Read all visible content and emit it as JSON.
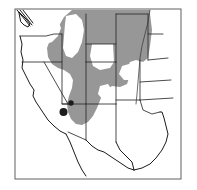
{
  "figure": {
    "kind": "distribution-map",
    "region": "Western United States",
    "width": 197,
    "height": 190,
    "background_color": "#ffffff"
  },
  "frame": {
    "x": 15,
    "y": 9,
    "width": 166,
    "height": 170,
    "stroke_color": "#6e6e6e",
    "fill_color": "#ffffff",
    "stroke_width": 1.1
  },
  "legend_colors": {
    "range_shading": "#979797",
    "range_gap": "#ffffff",
    "occurrence_point": "#1c1c1c",
    "state_boundary": "#2a2a2a",
    "coastline": "#1a1a1a",
    "river": "#3a3a3a",
    "frame": "#6e6e6e"
  },
  "range_shading": {
    "label": "shaded distribution range",
    "color": "#979797",
    "outline": "M 72,10 L 150,10 L 150,14 L 152,30 L 150,46 L 148,58 L 143,62 L 136,60 L 130,62 L 127,70 L 129,78 L 127,84 L 120,87 L 112,86 L 106,90 L 101,98 L 97,108 L 93,116 L 88,122 L 82,125 L 76,124 L 71,119 L 68,112 L 67,104 L 69,96 L 72,88 L 73,80 L 70,74 L 64,70 L 58,68 L 52,64 L 48,57 L 47,48 L 50,40 L 55,32 L 60,24 L 64,17 Z",
    "gaps": [
      {
        "name": "idaho-panhandle-gap",
        "path": "M 50,18 L 58,20 L 61,28 L 58,36 L 52,42 L 46,44 L 42,40 L 43,32 L 46,24 Z"
      },
      {
        "name": "central-idaho-gap",
        "path": "M 66,16 L 76,14 L 82,20 L 84,30 L 82,42 L 78,52 L 72,58 L 66,56 L 63,48 L 64,36 L 65,24 Z"
      },
      {
        "name": "wyoming-basin-gap",
        "path": "M 92,44 L 113,44 L 114,62 L 110,68 L 100,70 L 93,66 L 90,56 Z"
      },
      {
        "name": "eastern-plains-gap",
        "path": "M 122,66 L 136,62 L 142,66 L 140,74 L 132,80 L 124,80 L 119,74 Z"
      },
      {
        "name": "south-central-gap",
        "path": "M 100,86 L 108,84 L 112,90 L 110,98 L 103,100 L 98,94 Z"
      }
    ]
  },
  "state_boundaries": {
    "label": "state boundary lines",
    "paths": [
      {
        "name": "wa-or-border",
        "d": "M 20,36 L 46,36 L 54,34 L 62,34"
      },
      {
        "name": "or-ca-nv-border",
        "d": "M 22,62 L 44,62 L 62,62 L 62,34"
      },
      {
        "name": "ca-nv-diagonal",
        "d": "M 44,62 L 68,104"
      },
      {
        "name": "nv-ut-border",
        "d": "M 62,62 L 62,104 L 68,104"
      },
      {
        "name": "id-mt-wy-vertical",
        "d": "M 86,14 L 86,44 L 86,62"
      },
      {
        "name": "wy-north-border",
        "d": "M 86,44 L 116,44"
      },
      {
        "name": "wy-south-border",
        "d": "M 86,62 L 116,62"
      },
      {
        "name": "wy-east-border",
        "d": "M 116,14 L 116,62"
      },
      {
        "name": "mt-nd-border",
        "d": "M 116,14 L 148,14"
      },
      {
        "name": "ut-co-border",
        "d": "M 86,62 L 86,104 L 62,104"
      },
      {
        "name": "co-east-border",
        "d": "M 116,62 L 116,104"
      },
      {
        "name": "co-south-border",
        "d": "M 86,104 L 116,104"
      },
      {
        "name": "az-nm-border",
        "d": "M 86,104 L 86,140"
      },
      {
        "name": "az-south-border",
        "d": "M 68,132 L 86,140"
      },
      {
        "name": "nm-east-border",
        "d": "M 116,104 L 116,142"
      },
      {
        "name": "nd-sd-border",
        "d": "M 148,34 L 163,34"
      },
      {
        "name": "sd-ne-border",
        "d": "M 148,60 L 168,58"
      },
      {
        "name": "ne-ks-border",
        "d": "M 140,82 L 171,80"
      },
      {
        "name": "ks-ok-border",
        "d": "M 140,100 L 173,98"
      },
      {
        "name": "ok-tx-panhandle",
        "d": "M 116,100 L 140,100"
      },
      {
        "name": "nd-mt-east",
        "d": "M 148,14 L 148,34 L 148,60"
      },
      {
        "name": "ne-east-edge",
        "d": "M 140,60 L 140,100"
      },
      {
        "name": "ok-south-border",
        "d": "M 140,100 L 143,110 L 152,114 L 160,112"
      }
    ]
  },
  "coastlines": {
    "label": "pacific coast and borders",
    "paths": [
      {
        "name": "washington-coast",
        "d": "M 19,12 L 26,19 L 30,24 L 28,27 L 24,25 L 21,22 Z"
      },
      {
        "name": "puget-sound-lines",
        "d": "M 17,10 L 30,26 M 20,10 L 32,25 M 23,10 L 33,23"
      },
      {
        "name": "oregon-california-coast",
        "d": "M 20,36 L 22,44 L 21,52 L 23,60 L 22,68 L 26,76 L 30,84 L 34,90 L 33,96 L 36,102 L 40,108 L 44,114 L 48,120 L 54,126 L 60,131 L 66,134"
      },
      {
        "name": "baja-gulf",
        "d": "M 66,134 L 70,142 L 74,152 L 78,162 L 82,170 L 86,176"
      },
      {
        "name": "mexico-border-south",
        "d": "M 86,140 L 92,146 L 98,150 L 104,152 L 110,156 L 116,160 L 122,164 L 128,168 L 134,170"
      },
      {
        "name": "texas-gulf-coast",
        "d": "M 134,170 L 142,168 L 150,164 L 156,158 L 162,150 L 166,142 L 168,134 L 166,126 L 164,118 L 162,112 L 160,112"
      },
      {
        "name": "texas-west-edge",
        "d": "M 116,142 L 120,150 L 126,156 L 132,162 L 134,170"
      }
    ]
  },
  "rivers": {
    "label": "river course",
    "paths": [
      {
        "name": "missouri-river",
        "d": "M 150,10 L 148,22 L 145,34 L 142,46 L 140,58 L 139,70 L 138,82 L 137,94 L 136,104"
      }
    ]
  },
  "occurrence_points": {
    "label": "occurrence records",
    "color": "#1c1c1c",
    "points": [
      {
        "name": "occurrence-point-north",
        "cx": 71,
        "cy": 103,
        "r": 2.7
      },
      {
        "name": "occurrence-point-south",
        "cx": 63.5,
        "cy": 112,
        "r": 4.0
      }
    ]
  }
}
